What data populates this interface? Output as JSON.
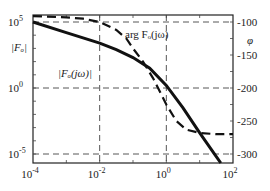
{
  "chart_data": {
    "type": "line",
    "title": "",
    "xscale": "log",
    "xlim": [
      0.0001,
      100
    ],
    "x_ticks": [
      {
        "value": -4,
        "label_base": "10",
        "label_exp": "-4"
      },
      {
        "value": -2,
        "label_base": "10",
        "label_exp": "-2"
      },
      {
        "value": 0,
        "label_base": "10",
        "label_exp": "0"
      },
      {
        "value": 2,
        "label_base": "10",
        "label_exp": "2"
      }
    ],
    "left_axis": {
      "label": "|F_o|",
      "label_display": "|Fₒ|",
      "scale": "log",
      "ticks": [
        {
          "value": 5,
          "label_base": "10",
          "label_exp": "5"
        },
        {
          "value": 0,
          "label_base": "10",
          "label_exp": "0"
        },
        {
          "value": -5,
          "label_base": "10",
          "label_exp": "-5"
        }
      ]
    },
    "right_axis": {
      "label": "φ",
      "ticks": [
        -100,
        -150,
        -200,
        -250,
        -300
      ]
    },
    "grid": "dashed at x=10^-2,10^0 and y=10^5,10^0,10^-5",
    "series": [
      {
        "name": "|F_o(jω)|",
        "display": "|Fₒ(jω)|",
        "axis": "left",
        "style": "solid-thick",
        "log_omega": [
          -4,
          -3,
          -2,
          -1.5,
          -1,
          -0.5,
          0,
          0.5,
          1,
          1.5,
          2,
          2.25
        ],
        "log_magnitude": [
          5,
          4.2,
          3.4,
          2.9,
          2.3,
          1.5,
          0.2,
          -1.5,
          -3.4,
          -5.2,
          -7.0,
          -7.9
        ]
      },
      {
        "name": "arg F_o(jω)",
        "display": "arg Fₒ(jω)",
        "axis": "right",
        "style": "dashed-thick",
        "log_omega": [
          -4,
          -3,
          -2.5,
          -2,
          -1.5,
          -1.2,
          -1,
          -0.7,
          -0.4,
          -0.2,
          0,
          0.3,
          0.6,
          1,
          1.5,
          2
        ],
        "phase_deg": [
          -91,
          -93,
          -95,
          -100,
          -112,
          -125,
          -140,
          -160,
          -185,
          -205,
          -225,
          -250,
          -263,
          -268,
          -270,
          -270
        ]
      }
    ]
  },
  "labels": {
    "magnitude_curve": "|Fₒ(jω)|",
    "phase_curve": "arg Fₒ(jω)",
    "left_axis": "|Fₒ|",
    "right_axis": "φ"
  }
}
